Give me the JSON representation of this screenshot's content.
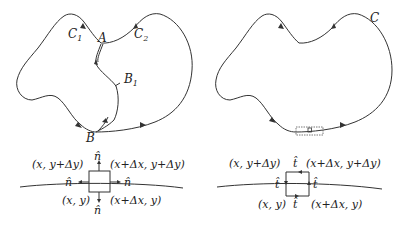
{
  "left_panel": {
    "labels": {
      "C1": "C",
      "C1_sub": "1",
      "C2": "C",
      "C2_sub": "2",
      "A": "A",
      "B": "B",
      "B1": "B",
      "B1_sub": "1"
    },
    "detail": {
      "top_left": "(x, y+Δy)",
      "top_right": "(x+Δx, y+Δy)",
      "bottom_left": "(x, y)",
      "bottom_right": "(x+Δx, y)",
      "normal_top": "n̂",
      "normal_left": "n̂",
      "normal_right": "n̂",
      "normal_bottom": "n̂"
    }
  },
  "right_panel": {
    "labels": {
      "C": "C"
    },
    "detail": {
      "top_left": "(x, y+Δy)",
      "top_right": "(x+Δx, y+Δy)",
      "bottom_left": "(x, y)",
      "bottom_right": "(x+Δx, y)",
      "tangent_top": "t̂",
      "tangent_left": "t̂",
      "tangent_right": "t̂",
      "tangent_bottom": "t̂"
    }
  },
  "colors": {
    "stroke": "#333333",
    "text": "#222222",
    "background": "#ffffff"
  }
}
